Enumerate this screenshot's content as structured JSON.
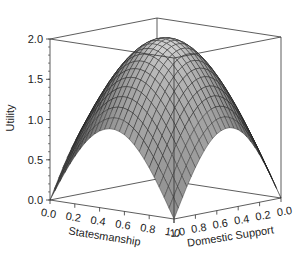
{
  "chart_data": {
    "type": "surface3d",
    "title": "",
    "function": "Utility = sin(pi*Statesmanship) + sin(pi*DomesticSupport)",
    "x": {
      "label": "Statesmanship",
      "ticks": [
        "0.0",
        "0.2",
        "0.4",
        "0.6",
        "0.8",
        "1.0"
      ],
      "range": [
        0,
        1
      ]
    },
    "y": {
      "label": "Domestic Support",
      "ticks": [
        "1.0",
        "0.8",
        "0.6",
        "0.4",
        "0.2",
        "0.0"
      ],
      "range": [
        0,
        1
      ]
    },
    "z": {
      "label": "Utility",
      "ticks": [
        "0.0",
        "0.5",
        "1.0",
        "1.5",
        "2.0"
      ],
      "range": [
        0,
        2
      ]
    },
    "grid_resolution": 25,
    "sample_values": {
      "corners": {
        "S0_D0": 0.0,
        "S1_D0": 0.0,
        "S0_D1": 0.0,
        "S1_D1": 0.0
      },
      "edge_midpoints": 1.0,
      "center_peak": 2.0
    },
    "surface_color": "#8a8a8a",
    "mesh_line_color": "#1a1a1a",
    "box_color": "#333333"
  }
}
